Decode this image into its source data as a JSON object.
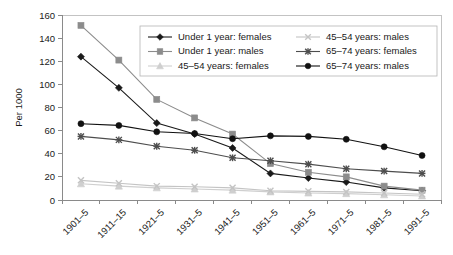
{
  "chart_data": {
    "type": "line",
    "title": "",
    "xlabel": "",
    "ylabel": "Per 1000",
    "ylim": [
      0,
      160
    ],
    "yticks": [
      0,
      20,
      40,
      60,
      80,
      100,
      120,
      140,
      160
    ],
    "grid": false,
    "legend_position": "top-center",
    "categories": [
      "1901–5",
      "1911–15",
      "1921–5",
      "1931–5",
      "1941–5",
      "1951–5",
      "1961–5",
      "1971–5",
      "1981–5",
      "1991–5"
    ],
    "series": [
      {
        "name": "Under 1 year: females",
        "marker": "diamond",
        "color": "#1a1a1a",
        "values": [
          124,
          97,
          66.5,
          57,
          45,
          23,
          19,
          15.5,
          10.5,
          8
        ]
      },
      {
        "name": "Under 1 year: males",
        "marker": "square",
        "color": "#8c8c8c",
        "values": [
          151,
          121,
          87,
          71,
          57,
          31.5,
          24,
          20,
          12,
          8.5
        ]
      },
      {
        "name": "45–54 years: females",
        "marker": "triangle",
        "color": "#cfcfcf",
        "values": [
          14,
          12,
          10.5,
          9.5,
          8.5,
          7,
          6,
          5.5,
          4.5,
          3.5
        ]
      },
      {
        "name": "45–54 years: males",
        "marker": "cross",
        "color": "#c4c4c4",
        "values": [
          17,
          14.5,
          12,
          11.5,
          10.5,
          8,
          7.5,
          7,
          6,
          5
        ]
      },
      {
        "name": "65–74 years: females",
        "marker": "star",
        "color": "#4d4d4d",
        "values": [
          55,
          52,
          46.5,
          43,
          36.5,
          34,
          31,
          27,
          25,
          23
        ]
      },
      {
        "name": "65–74 years: males",
        "marker": "circle",
        "color": "#111111",
        "values": [
          66,
          64.5,
          59,
          57.5,
          53,
          55.5,
          55,
          52.5,
          46,
          38.5
        ]
      }
    ],
    "legend_columns": [
      [
        "Under 1 year: females",
        "Under 1 year: males",
        "45–54 years: females"
      ],
      [
        "45–54 years: males",
        "65–74 years: females",
        "65–74 years: males"
      ]
    ]
  }
}
